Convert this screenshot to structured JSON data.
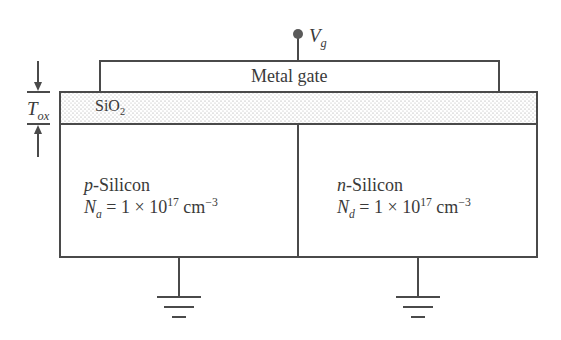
{
  "diagram": {
    "terminal": {
      "symbol": "V",
      "subscript": "g"
    },
    "gate": {
      "label": "Metal gate"
    },
    "oxide": {
      "label": "SiO",
      "subscript": "2",
      "thickness_symbol": "T",
      "thickness_subscript": "ox"
    },
    "regions": [
      {
        "type_letter": "p",
        "type_rest": "-Silicon",
        "doping_symbol": "N",
        "doping_subscript": "a",
        "doping_value": " = 1 × 10",
        "doping_exponent": "17",
        "unit": " cm",
        "unit_exponent": "−3"
      },
      {
        "type_letter": "n",
        "type_rest": "-Silicon",
        "doping_symbol": "N",
        "doping_subscript": "d",
        "doping_value": " = 1 × 10",
        "doping_exponent": "17",
        "unit": " cm",
        "unit_exponent": "−3"
      }
    ],
    "grounds": [
      "ground-left",
      "ground-right"
    ],
    "colors": {
      "line": "#4a4a4a",
      "text": "#3a3a3a",
      "oxide_dots": "#9a9a9a"
    }
  }
}
